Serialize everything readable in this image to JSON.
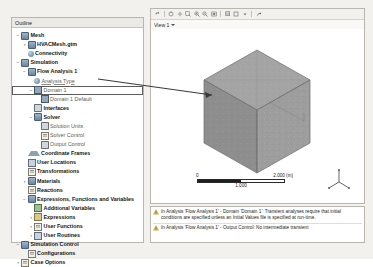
{
  "window": {
    "background": "#f2f1ee"
  },
  "outline": {
    "header_title": "Outline",
    "tree": [
      {
        "label": "Mesh",
        "depth": 0,
        "twisty": "−",
        "icon": "cyl",
        "bold": true,
        "dim": false
      },
      {
        "label": "HVACMesh.gtm",
        "depth": 1,
        "twisty": "›",
        "icon": "cyl",
        "bold": true,
        "dim": false
      },
      {
        "label": "Connectivity",
        "depth": 1,
        "twisty": "",
        "icon": "globe",
        "bold": true,
        "dim": false
      },
      {
        "label": "Simulation",
        "depth": 0,
        "twisty": "−",
        "icon": "cyl",
        "bold": true,
        "dim": false
      },
      {
        "label": "Flow Analysis 1",
        "depth": 1,
        "twisty": "−",
        "icon": "cyl",
        "bold": true,
        "dim": false
      },
      {
        "label": "Analysis Type",
        "depth": 2,
        "twisty": "",
        "icon": "globe",
        "bold": false,
        "dim": true
      },
      {
        "label": "Domain 1",
        "depth": 2,
        "twisty": "−",
        "icon": "dom",
        "bold": false,
        "dim": true
      },
      {
        "label": "Domain 1 Default",
        "depth": 3,
        "twisty": "",
        "icon": "dom",
        "bold": false,
        "dim": true
      },
      {
        "label": "Interfaces",
        "depth": 2,
        "twisty": "",
        "icon": "pen",
        "bold": true,
        "dim": false
      },
      {
        "label": "Solver",
        "depth": 2,
        "twisty": "−",
        "icon": "cyl",
        "bold": true,
        "dim": false
      },
      {
        "label": "Solution Units",
        "depth": 3,
        "twisty": "",
        "icon": "pen",
        "bold": false,
        "dim": true
      },
      {
        "label": "Solver Control",
        "depth": 3,
        "twisty": "",
        "icon": "sheet",
        "bold": false,
        "dim": true
      },
      {
        "label": "Output Control",
        "depth": 3,
        "twisty": "",
        "icon": "pen",
        "bold": false,
        "dim": true
      },
      {
        "label": "Coordinate Frames",
        "depth": 1,
        "twisty": "",
        "icon": "tri",
        "bold": true,
        "dim": false
      },
      {
        "label": "User Locations",
        "depth": 1,
        "twisty": "",
        "icon": "sq",
        "bold": true,
        "dim": false
      },
      {
        "label": "Transformations",
        "depth": 1,
        "twisty": "",
        "icon": "sheet",
        "bold": true,
        "dim": false
      },
      {
        "label": "Materials",
        "depth": 1,
        "twisty": "›",
        "icon": "cyl",
        "bold": true,
        "dim": false
      },
      {
        "label": "Reactions",
        "depth": 1,
        "twisty": "",
        "icon": "sheet",
        "bold": true,
        "dim": false
      },
      {
        "label": "Expressions, Functions and Variables",
        "depth": 1,
        "twisty": "−",
        "icon": "cyl",
        "bold": true,
        "dim": false
      },
      {
        "label": "Additional Variables",
        "depth": 2,
        "twisty": "",
        "icon": "grn",
        "bold": true,
        "dim": false
      },
      {
        "label": "Expressions",
        "depth": 2,
        "twisty": "›",
        "icon": "ylw",
        "bold": true,
        "dim": false
      },
      {
        "label": "User Functions",
        "depth": 2,
        "twisty": "›",
        "icon": "sheet",
        "bold": true,
        "dim": false
      },
      {
        "label": "User Routines",
        "depth": 2,
        "twisty": "›",
        "icon": "sq",
        "bold": true,
        "dim": false
      },
      {
        "label": "Simulation Control",
        "depth": 0,
        "twisty": "−",
        "icon": "cyl",
        "bold": true,
        "dim": false
      },
      {
        "label": "Configurations",
        "depth": 1,
        "twisty": "",
        "icon": "sheet",
        "bold": true,
        "dim": false
      },
      {
        "label": "Case Options",
        "depth": 0,
        "twisty": "›",
        "icon": "sheet",
        "bold": true,
        "dim": false
      }
    ],
    "selected_label": "Domain 1"
  },
  "viewer": {
    "toolbar_icons": [
      "undo-icon",
      "rotate-icon",
      "pan-icon",
      "zoom-box-icon",
      "zoom-in-icon",
      "zoom-out-icon",
      "fit-view-icon",
      "render-mode-icon",
      "view-preset-icon",
      "view-preset-dropdown-icon",
      "measure-icon"
    ],
    "tab_label": "View 1",
    "scale_bar": {
      "left_label": "0",
      "mid_label": "1.000",
      "right_label": "2.000 (m)"
    },
    "axis_triad": {
      "x": "X",
      "y": "Y",
      "z": "Z"
    },
    "object_name": "Domain 1",
    "object_color": "#9a9a9a"
  },
  "messages": [
    {
      "icon": "warning-icon",
      "text": "In Analysis 'Flow Analysis 1' - Domain 'Domain 1': Transient analyses require that initial conditions are specified unless an Initial Values file is specified at run-time."
    },
    {
      "icon": "warning-icon",
      "text": "In Analysis 'Flow Analysis 1' - Output Control: No intermediate transient"
    }
  ]
}
